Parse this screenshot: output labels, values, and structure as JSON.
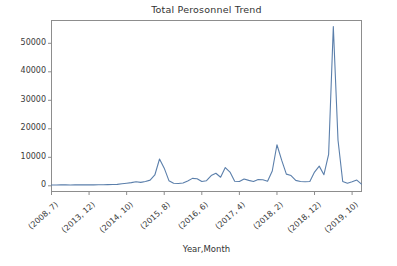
{
  "chart_data": {
    "type": "line",
    "title": "Total Perosonnel Trend",
    "xlabel": "Year,Month",
    "ylabel": "",
    "grid": false,
    "legend": false,
    "legend_position": "none",
    "line_color": "#5b7fab",
    "ylim": [
      -2000,
      58000
    ],
    "yticks": [
      0,
      10000,
      20000,
      30000,
      40000,
      50000
    ],
    "ytick_labels": [
      "0",
      "10000",
      "20000",
      "30000",
      "40000",
      "50000"
    ],
    "xtick_labels": [
      "(2008, 7)",
      "(2013, 12)",
      "(2014, 10)",
      "(2015, 8)",
      "(2016, 6)",
      "(2017, 4)",
      "(2018, 2)",
      "(2018, 12)",
      "(2019, 10)"
    ],
    "xtick_positions": [
      0,
      8,
      16,
      24,
      32,
      40,
      48,
      56,
      64
    ],
    "xlim": [
      0,
      66
    ],
    "x": [
      0,
      1,
      2,
      3,
      4,
      5,
      6,
      7,
      8,
      9,
      10,
      11,
      12,
      13,
      14,
      15,
      16,
      17,
      18,
      19,
      20,
      21,
      22,
      23,
      24,
      25,
      26,
      27,
      28,
      29,
      30,
      31,
      32,
      33,
      34,
      35,
      36,
      37,
      38,
      39,
      40,
      41,
      42,
      43,
      44,
      45,
      46,
      47,
      48,
      49,
      50,
      51,
      52,
      53,
      54,
      55,
      56,
      57,
      58,
      59,
      60,
      61,
      62,
      63,
      64,
      65,
      66
    ],
    "values": [
      300,
      300,
      320,
      310,
      300,
      320,
      330,
      320,
      340,
      330,
      350,
      360,
      400,
      450,
      500,
      700,
      900,
      1100,
      1400,
      1200,
      1500,
      2000,
      3800,
      9400,
      6200,
      1800,
      900,
      800,
      1000,
      1700,
      2600,
      2500,
      1500,
      1800,
      3600,
      4400,
      3000,
      6400,
      4800,
      1600,
      1500,
      2400,
      1900,
      1500,
      2200,
      2100,
      1600,
      5200,
      14400,
      9000,
      4100,
      3600,
      1900,
      1500,
      1400,
      1500,
      4800,
      6900,
      3900,
      11000,
      55900,
      16000,
      1500,
      900,
      1400,
      2000,
      600
    ],
    "series_name": "Total Personnel",
    "peak_value": 55900,
    "peak_label": "(2018, 2) region peak"
  }
}
